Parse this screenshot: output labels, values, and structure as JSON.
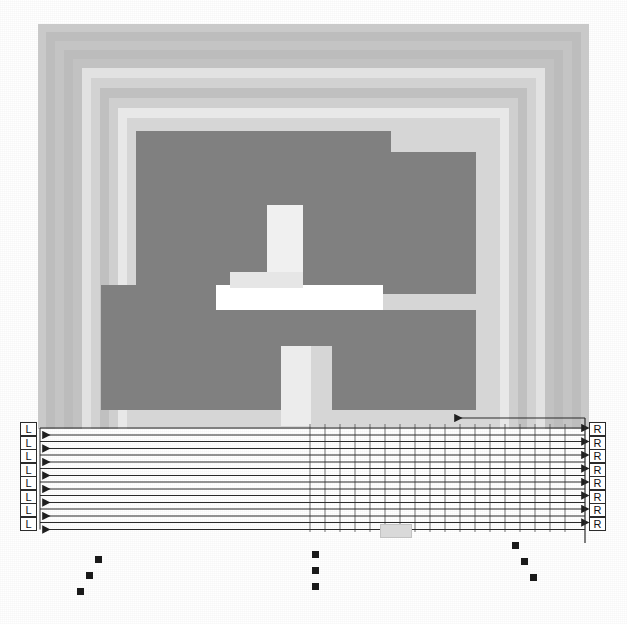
{
  "figure": {
    "canvas": {
      "width": 627,
      "height": 624,
      "background": "#ffffff"
    }
  },
  "palette": {
    "dark_gray": "#808080",
    "mid_gray": "#a8a8a8",
    "light_gray": "#c9c9c9",
    "pale_gray": "#dedede",
    "near_white": "#f2f2f2",
    "white": "#ffffff",
    "line": "#2b2b2b",
    "tab": "#d9d9d9"
  },
  "outer_rings": [
    {
      "name": "ring-1",
      "x": 38,
      "y": 24,
      "w": 551,
      "h": 405,
      "color": "#c9c9c9"
    },
    {
      "name": "ring-2",
      "x": 46,
      "y": 32,
      "w": 535,
      "h": 397,
      "color": "#bdbdbd"
    },
    {
      "name": "ring-3",
      "x": 55,
      "y": 41,
      "w": 517,
      "h": 388,
      "color": "#c4c4c4"
    },
    {
      "name": "ring-4",
      "x": 64,
      "y": 50,
      "w": 499,
      "h": 379,
      "color": "#bcbcbc"
    },
    {
      "name": "ring-5",
      "x": 73,
      "y": 59,
      "w": 481,
      "h": 370,
      "color": "#c2c2c2"
    },
    {
      "name": "ring-6",
      "x": 82,
      "y": 68,
      "w": 463,
      "h": 361,
      "color": "#e2e2e2"
    },
    {
      "name": "ring-7",
      "x": 91,
      "y": 78,
      "w": 445,
      "h": 351,
      "color": "#d2d2d2"
    },
    {
      "name": "ring-8",
      "x": 100,
      "y": 88,
      "w": 427,
      "h": 341,
      "color": "#c0c0c0"
    },
    {
      "name": "ring-9",
      "x": 109,
      "y": 98,
      "w": 409,
      "h": 331,
      "color": "#cfcfcf"
    },
    {
      "name": "ring-10",
      "x": 118,
      "y": 108,
      "w": 391,
      "h": 321,
      "color": "#e8e8e8"
    },
    {
      "name": "ring-11",
      "x": 127,
      "y": 118,
      "w": 373,
      "h": 311,
      "color": "#d6d6d6"
    }
  ],
  "blocks": [
    {
      "name": "block-upper-left",
      "x": 136,
      "y": 131,
      "w": 255,
      "h": 163,
      "color": "#808080"
    },
    {
      "name": "block-upper-right",
      "x": 391,
      "y": 152,
      "w": 85,
      "h": 142,
      "color": "#808080"
    },
    {
      "name": "block-lower-left",
      "x": 101,
      "y": 285,
      "w": 198,
      "h": 125,
      "color": "#808080"
    },
    {
      "name": "block-lower-right",
      "x": 332,
      "y": 310,
      "w": 144,
      "h": 100,
      "color": "#808080"
    },
    {
      "name": "block-lower-mid",
      "x": 299,
      "y": 310,
      "w": 33,
      "h": 36,
      "color": "#808080"
    }
  ],
  "channels": [
    {
      "name": "channel-vertical-upper",
      "x": 267,
      "y": 205,
      "w": 36,
      "h": 90,
      "color": "#f0f0f0"
    },
    {
      "name": "channel-horizontal-mid",
      "x": 216,
      "y": 285,
      "w": 167,
      "h": 25,
      "color": "#ffffff"
    },
    {
      "name": "channel-vertical-lower",
      "x": 281,
      "y": 346,
      "w": 30,
      "h": 80,
      "color": "#ececec"
    },
    {
      "name": "channel-elbow",
      "x": 230,
      "y": 272,
      "w": 73,
      "h": 16,
      "color": "#e6e6e6"
    }
  ],
  "bus": {
    "name": "arrow-bus",
    "row_count": 8,
    "left_x": 40,
    "right_x": 585,
    "first_row_y": 435,
    "row_spacing": 13.5,
    "line_color": "#2b2b2b",
    "extra_arrow": {
      "name": "feedback-arrow",
      "x": 455,
      "y": 418,
      "direction": "left"
    }
  },
  "left_terminals": {
    "name": "left-terminal-column",
    "label": "L",
    "items": [
      "L",
      "L",
      "L",
      "L",
      "L",
      "L",
      "L",
      "L"
    ]
  },
  "right_terminals": {
    "name": "right-terminal-column",
    "label": "R",
    "items": [
      "R",
      "R",
      "R",
      "R",
      "R",
      "R",
      "R",
      "R"
    ]
  },
  "ellipses": [
    {
      "name": "ellipsis-left",
      "kind": "diagonal-down-left",
      "x": 95,
      "y": 556,
      "dots": 3
    },
    {
      "name": "ellipsis-center",
      "kind": "vertical",
      "x": 312,
      "y": 551,
      "dots": 3
    },
    {
      "name": "ellipsis-right",
      "kind": "diagonal-down-right",
      "x": 512,
      "y": 542,
      "dots": 3
    }
  ],
  "bottom_tab": {
    "name": "bottom-tab",
    "x": 380,
    "y": 524,
    "w": 30,
    "h": 12
  },
  "vertical_guides": {
    "name": "vertical-guide-lines",
    "start_x": 310,
    "count": 18,
    "spacing": 15,
    "top_y": 424,
    "bottom_y": 532,
    "color": "#6f6f6f"
  }
}
